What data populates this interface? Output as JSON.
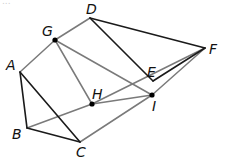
{
  "figure": {
    "type": "geometry-diagram",
    "top_text_fragment": "..."
  },
  "colors": {
    "dark_segment": "#1a1a1a",
    "gray_segment": "#7a7a7a",
    "point": "#000000"
  },
  "points": [
    {
      "id": "A",
      "label": "A",
      "x": 20,
      "y": 72,
      "lx": 6,
      "ly": 70
    },
    {
      "id": "B",
      "label": "B",
      "x": 27,
      "y": 128,
      "lx": 12,
      "ly": 139
    },
    {
      "id": "C",
      "label": "C",
      "x": 80,
      "y": 142,
      "lx": 76,
      "ly": 157
    },
    {
      "id": "D",
      "label": "D",
      "x": 90,
      "y": 18,
      "lx": 86,
      "ly": 14
    },
    {
      "id": "E",
      "label": "E",
      "x": 153,
      "y": 81,
      "lx": 147,
      "ly": 77
    },
    {
      "id": "F",
      "label": "F",
      "x": 205,
      "y": 48,
      "lx": 209,
      "ly": 54
    },
    {
      "id": "G",
      "label": "G",
      "x": 55,
      "y": 40,
      "lx": 42,
      "ly": 36
    },
    {
      "id": "H",
      "label": "H",
      "x": 92,
      "y": 104,
      "lx": 92,
      "ly": 99
    },
    {
      "id": "I",
      "label": "I",
      "x": 152,
      "y": 95,
      "lx": 152,
      "ly": 111
    }
  ],
  "dots": [
    "G",
    "H",
    "I"
  ],
  "segments": {
    "dark": [
      [
        "A",
        "B"
      ],
      [
        "A",
        "C"
      ],
      [
        "B",
        "C"
      ],
      [
        "D",
        "F"
      ],
      [
        "D",
        "E"
      ],
      [
        "E",
        "F"
      ]
    ],
    "gray": [
      [
        "A",
        "G"
      ],
      [
        "G",
        "D"
      ],
      [
        "G",
        "H"
      ],
      [
        "G",
        "I"
      ],
      [
        "B",
        "H"
      ],
      [
        "H",
        "F"
      ],
      [
        "H",
        "I"
      ],
      [
        "C",
        "I"
      ],
      [
        "I",
        "F"
      ]
    ]
  }
}
